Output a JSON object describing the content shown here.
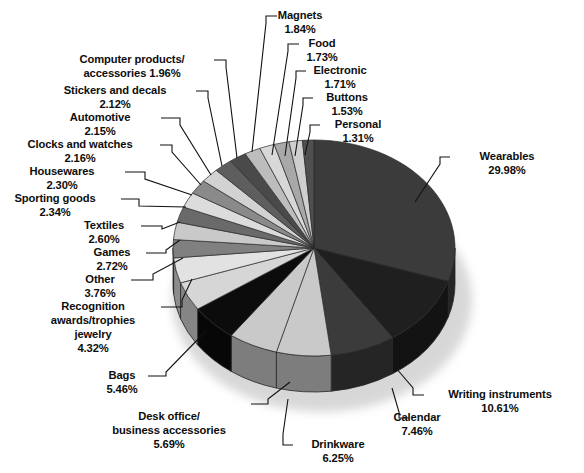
{
  "chart_data": {
    "type": "pie",
    "title": "",
    "subtitle": "",
    "xlabel": "",
    "ylabel": "",
    "legend_position": "callout-labels",
    "grid": false,
    "style": "3d-exploded-pie",
    "value_unit": "percent",
    "start_angle_deg": 0,
    "direction": "clockwise",
    "categories": [
      "Wearables",
      "Writing instruments",
      "Calendar",
      "Drinkware",
      "Desk office/ business accessories",
      "Bags",
      "Recognition awards/trophies jewelry",
      "Other",
      "Games",
      "Textiles",
      "Sporting goods",
      "Housewares",
      "Clocks and watches",
      "Automotive",
      "Stickers and decals",
      "Computer products/ accessories",
      "Magnets",
      "Food",
      "Electronic",
      "Buttons",
      "Personal"
    ],
    "values": [
      29.98,
      10.61,
      7.46,
      6.25,
      5.69,
      5.46,
      4.32,
      3.76,
      2.72,
      2.6,
      2.34,
      2.3,
      2.16,
      2.15,
      2.12,
      1.96,
      1.84,
      1.73,
      1.71,
      1.53,
      1.31
    ],
    "colors": [
      "#3b3b3b",
      "#1f1f1f",
      "#3b3b3b",
      "#c9c9c9",
      "#c9c9c9",
      "#0c0c0c",
      "#d6d6d6",
      "#e2e2e2",
      "#808080",
      "#c9c9c9",
      "#6a6a6a",
      "#dcdcdc",
      "#8a8a8a",
      "#d2d2d2",
      "#5e5e5e",
      "#4a4a4a",
      "#bdbdbd",
      "#d8d8d8",
      "#a8a8a8",
      "#cfcfcf",
      "#4f4f4f"
    ],
    "slices": [
      {
        "name": "Wearables",
        "value": 29.98,
        "label": "Wearables",
        "percent_text": "29.98%",
        "color": "#3b3b3b"
      },
      {
        "name": "Writing instruments",
        "value": 10.61,
        "label": "Writing instruments",
        "percent_text": "10.61%",
        "color": "#1f1f1f"
      },
      {
        "name": "Calendar",
        "value": 7.46,
        "label": "Calendar",
        "percent_text": "7.46%",
        "color": "#3b3b3b"
      },
      {
        "name": "Drinkware",
        "value": 6.25,
        "label": "Drinkware",
        "percent_text": "6.25%",
        "color": "#c9c9c9"
      },
      {
        "name": "Desk office/ business accessories",
        "value": 5.69,
        "label": "Desk office/ business accessories",
        "percent_text": "5.69%",
        "color": "#c9c9c9"
      },
      {
        "name": "Bags",
        "value": 5.46,
        "label": "Bags",
        "percent_text": "5.46%",
        "color": "#0c0c0c"
      },
      {
        "name": "Recognition awards/trophies jewelry",
        "value": 4.32,
        "label": "Recognition awards/trophies jewelry",
        "percent_text": "4.32%",
        "color": "#d6d6d6"
      },
      {
        "name": "Other",
        "value": 3.76,
        "label": "Other",
        "percent_text": "3.76%",
        "color": "#e2e2e2"
      },
      {
        "name": "Games",
        "value": 2.72,
        "label": "Games",
        "percent_text": "2.72%",
        "color": "#808080"
      },
      {
        "name": "Textiles",
        "value": 2.6,
        "label": "Textiles",
        "percent_text": "2.60%",
        "color": "#c9c9c9"
      },
      {
        "name": "Sporting goods",
        "value": 2.34,
        "label": "Sporting goods",
        "percent_text": "2.34%",
        "color": "#6a6a6a"
      },
      {
        "name": "Housewares",
        "value": 2.3,
        "label": "Housewares",
        "percent_text": "2.30%",
        "color": "#dcdcdc"
      },
      {
        "name": "Clocks and watches",
        "value": 2.16,
        "label": "Clocks and watches",
        "percent_text": "2.16%",
        "color": "#8a8a8a"
      },
      {
        "name": "Automotive",
        "value": 2.15,
        "label": "Automotive",
        "percent_text": "2.15%",
        "color": "#d2d2d2"
      },
      {
        "name": "Stickers and decals",
        "value": 2.12,
        "label": "Stickers and decals",
        "percent_text": "2.12%",
        "color": "#5e5e5e"
      },
      {
        "name": "Computer products/ accessories",
        "value": 1.96,
        "label": "Computer products/ accessories",
        "percent_text": "1.96%",
        "color": "#4a4a4a"
      },
      {
        "name": "Magnets",
        "value": 1.84,
        "label": "Magnets",
        "percent_text": "1.84%",
        "color": "#bdbdbd"
      },
      {
        "name": "Food",
        "value": 1.73,
        "label": "Food",
        "percent_text": "1.73%",
        "color": "#d8d8d8"
      },
      {
        "name": "Electronic",
        "value": 1.71,
        "label": "Electronic",
        "percent_text": "1.71%",
        "color": "#a8a8a8"
      },
      {
        "name": "Buttons",
        "value": 1.53,
        "label": "Buttons",
        "percent_text": "1.53%",
        "color": "#cfcfcf"
      },
      {
        "name": "Personal",
        "value": 1.31,
        "label": "Personal",
        "percent_text": "1.31%",
        "color": "#4f4f4f"
      }
    ]
  },
  "callouts": [
    {
      "id": "magnets",
      "lines": [
        "Magnets",
        "1.84%"
      ],
      "anchor": "middle",
      "x": 300,
      "y": 19,
      "dy": 14
    },
    {
      "id": "food",
      "lines": [
        "Food",
        "1.73%"
      ],
      "anchor": "middle",
      "x": 322,
      "y": 47,
      "dy": 14
    },
    {
      "id": "electronic",
      "lines": [
        "Electronic",
        "1.71%"
      ],
      "anchor": "middle",
      "x": 340,
      "y": 74,
      "dy": 14
    },
    {
      "id": "buttons",
      "lines": [
        "Buttons",
        "1.53%"
      ],
      "anchor": "middle",
      "x": 347,
      "y": 101,
      "dy": 14
    },
    {
      "id": "personal",
      "lines": [
        "Personal",
        "1.31%"
      ],
      "anchor": "middle",
      "x": 358,
      "y": 128,
      "dy": 14
    },
    {
      "id": "computer",
      "lines": [
        "Computer products/",
        "accessories 1.96%"
      ],
      "anchor": "middle",
      "x": 132,
      "y": 63,
      "dy": 14
    },
    {
      "id": "stickers",
      "lines": [
        "Stickers and decals",
        "2.12%"
      ],
      "anchor": "middle",
      "x": 115,
      "y": 94,
      "dy": 14
    },
    {
      "id": "automotive",
      "lines": [
        "Automotive",
        "2.15%"
      ],
      "anchor": "middle",
      "x": 100,
      "y": 121,
      "dy": 14
    },
    {
      "id": "clocks",
      "lines": [
        "Clocks and watches",
        "2.16%"
      ],
      "anchor": "middle",
      "x": 80,
      "y": 148,
      "dy": 14
    },
    {
      "id": "housewares",
      "lines": [
        "Housewares",
        "2.30%"
      ],
      "anchor": "middle",
      "x": 62,
      "y": 175,
      "dy": 14
    },
    {
      "id": "sporting",
      "lines": [
        "Sporting goods",
        "2.34%"
      ],
      "anchor": "middle",
      "x": 55,
      "y": 202,
      "dy": 14
    },
    {
      "id": "textiles",
      "lines": [
        "Textiles",
        "2.60%"
      ],
      "anchor": "middle",
      "x": 104,
      "y": 229,
      "dy": 14
    },
    {
      "id": "games",
      "lines": [
        "Games",
        "2.72%"
      ],
      "anchor": "middle",
      "x": 112,
      "y": 256,
      "dy": 14
    },
    {
      "id": "other",
      "lines": [
        "Other",
        "3.76%"
      ],
      "anchor": "middle",
      "x": 100,
      "y": 283,
      "dy": 14
    },
    {
      "id": "recognition",
      "lines": [
        "Recognition",
        "awards/trophies",
        "jewelry",
        "4.32%"
      ],
      "anchor": "middle",
      "x": 93,
      "y": 310,
      "dy": 14
    },
    {
      "id": "bags",
      "lines": [
        "Bags",
        "5.46%"
      ],
      "anchor": "middle",
      "x": 122,
      "y": 379,
      "dy": 14
    },
    {
      "id": "desk",
      "lines": [
        "Desk office/",
        "business accessories",
        "5.69%"
      ],
      "anchor": "middle",
      "x": 169,
      "y": 420,
      "dy": 14
    },
    {
      "id": "drinkware",
      "lines": [
        "Drinkware",
        "6.25%"
      ],
      "anchor": "middle",
      "x": 338,
      "y": 448,
      "dy": 14
    },
    {
      "id": "calendar",
      "lines": [
        "Calendar",
        "7.46%"
      ],
      "anchor": "middle",
      "x": 417,
      "y": 421,
      "dy": 14
    },
    {
      "id": "writing",
      "lines": [
        "Writing instruments",
        "10.61%"
      ],
      "anchor": "middle",
      "x": 500,
      "y": 398,
      "dy": 14
    },
    {
      "id": "wearables",
      "lines": [
        "Wearables",
        "29.98%"
      ],
      "anchor": "middle",
      "x": 507,
      "y": 160,
      "dy": 14
    }
  ],
  "leaders": [
    {
      "id": "magnets",
      "pts": "277,16 266,16 266,23 252,152"
    },
    {
      "id": "food",
      "pts": "299,44 288,44 288,51 272,155"
    },
    {
      "id": "electronic",
      "pts": "306,71 296,71 296,78 285,156"
    },
    {
      "id": "buttons",
      "pts": "313,98 303,98 303,105 295,156"
    },
    {
      "id": "personal",
      "pts": "320,125 310,125 310,132 305,155"
    },
    {
      "id": "computer",
      "pts": "214,60 226,60 226,67 237,158"
    },
    {
      "id": "stickers",
      "pts": "196,91 208,91 208,98 222,166"
    },
    {
      "id": "automotive",
      "pts": "161,118 180,118 180,125 211,175"
    },
    {
      "id": "clocks",
      "pts": "160,145 172,145 172,152 201,185"
    },
    {
      "id": "housewares",
      "pts": "125,172 145,172 145,179 192,195"
    },
    {
      "id": "sporting",
      "pts": "121,199 139,199 139,206 186,207"
    },
    {
      "id": "textiles",
      "pts": "141,226 162,226 162,229 180,222"
    },
    {
      "id": "games",
      "pts": "146,253 166,253 166,250 180,240"
    },
    {
      "id": "other",
      "pts": "131,280 153,280 153,274 183,258"
    },
    {
      "id": "recognition",
      "pts": "161,307 182,307 182,300 192,279"
    },
    {
      "id": "bags",
      "pts": "148,376 166,376 166,372 207,330"
    },
    {
      "id": "desk",
      "pts": "251,404 268,404 268,399 290,382"
    },
    {
      "id": "drinkware",
      "pts": "293,445 283,445 283,434 288,399"
    },
    {
      "id": "calendar",
      "pts": "409,418 399,418 399,412 392,388"
    },
    {
      "id": "writing",
      "pts": "424,395 413,395 413,388 396,368"
    },
    {
      "id": "wearables",
      "pts": "450,157 440,157 440,164 415,202"
    }
  ],
  "geometry": {
    "cx": 314,
    "cy": 248,
    "rx": 141,
    "ry": 108,
    "depth": 36
  }
}
